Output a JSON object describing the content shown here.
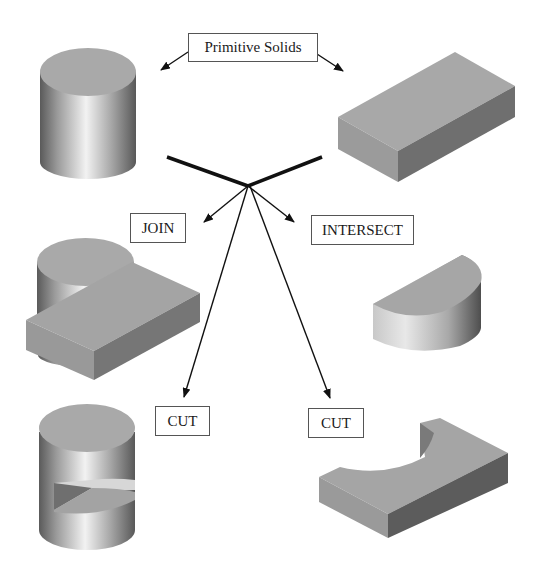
{
  "title": "Primitive Solids",
  "colors": {
    "background": "#ffffff",
    "line": "#111111",
    "box_border": "#555555",
    "solid_top": "#a9a9a9",
    "solid_side_light": "#9a9a9a",
    "solid_side_dark": "#6e6e6e",
    "cylinder_highlight": "#f2f2f2",
    "cylinder_shadow": "#5a5a5a"
  },
  "labels": {
    "primitive_solids": "Primitive Solids",
    "join": "JOIN",
    "intersect": "INTERSECT",
    "cut_left": "CUT",
    "cut_right": "CUT"
  },
  "solids": [
    {
      "id": "primitive-cylinder",
      "type": "cylinder",
      "role": "primitive"
    },
    {
      "id": "primitive-box",
      "type": "rectangular-block",
      "role": "primitive"
    },
    {
      "id": "join-result",
      "type": "cylinder-union-block",
      "operation": "JOIN"
    },
    {
      "id": "intersect-result",
      "type": "half-cylinder-segment",
      "operation": "INTERSECT"
    },
    {
      "id": "cut-cylinder-result",
      "type": "cylinder-with-wedge-cut",
      "operation": "CUT"
    },
    {
      "id": "cut-block-result",
      "type": "block-with-cylindrical-cutout",
      "operation": "CUT"
    }
  ]
}
